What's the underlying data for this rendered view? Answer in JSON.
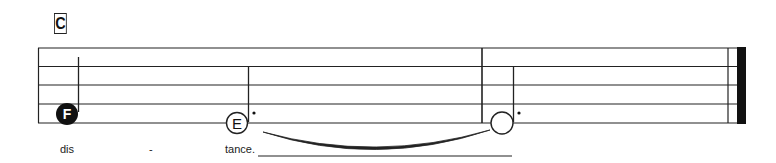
{
  "rehearsal_mark": "C",
  "staff": {
    "lines": 5,
    "line_color": "#222222",
    "top_y": 48,
    "spacing": 18.75,
    "left_x": 38,
    "right_x": 746
  },
  "notes": [
    {
      "name": "F",
      "type": "quarter",
      "filled": true,
      "x": 67,
      "y": 114,
      "stem_x": 78,
      "stem_top": 57,
      "dotted": false
    },
    {
      "name": "E",
      "type": "dotted-half",
      "filled": false,
      "x": 237,
      "y": 123,
      "stem_x": 248,
      "stem_top": 66,
      "dotted": true
    },
    {
      "name": "",
      "type": "dotted-half",
      "filled": false,
      "x": 502,
      "y": 123,
      "stem_x": 513,
      "stem_top": 66,
      "dotted": true
    }
  ],
  "barlines": [
    {
      "type": "single",
      "x": 482
    },
    {
      "type": "final",
      "x": 728
    }
  ],
  "tie": {
    "from_x": 263,
    "to_x": 490,
    "y": 132,
    "depth": 20
  },
  "lyrics": [
    {
      "text": "dis",
      "x": 60
    },
    {
      "text": "-",
      "x": 149
    },
    {
      "text": "tance.",
      "x": 225
    }
  ],
  "lyric_extender": {
    "x1": 258,
    "x2": 512,
    "y": 156
  }
}
